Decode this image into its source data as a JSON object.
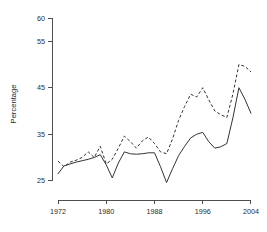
{
  "chart_data": {
    "type": "line",
    "title": "",
    "subtitle": "",
    "xlabel": "",
    "ylabel": "Percentage",
    "xlim": [
      1971,
      2005
    ],
    "ylim": [
      23,
      60
    ],
    "grid": false,
    "legend": "none",
    "background": "#ffffff",
    "line_color": "#333333",
    "axis_color": "#3d3d3d",
    "x_ticks": [
      1972,
      1980,
      1988,
      1996,
      2004
    ],
    "x_tick_labels": [
      "1972",
      "1980",
      "1988",
      "1996",
      "2004"
    ],
    "y_ticks": [
      25,
      35,
      45,
      55,
      60
    ],
    "y_tick_labels": [
      "25",
      "35",
      "45",
      "55",
      "60"
    ],
    "x": [
      1972,
      1973,
      1974,
      1975,
      1976,
      1977,
      1978,
      1979,
      1980,
      1981,
      1982,
      1983,
      1984,
      1985,
      1986,
      1987,
      1988,
      1989,
      1990,
      1991,
      1992,
      1993,
      1994,
      1995,
      1996,
      1997,
      1998,
      1999,
      2000,
      2001,
      2002,
      2003,
      2004
    ],
    "series": [
      {
        "name": "solid-series",
        "style": "solid",
        "values": [
          26.5,
          28.2,
          28.6,
          29.0,
          29.3,
          29.6,
          30.0,
          30.6,
          28.4,
          25.6,
          28.8,
          31.2,
          30.8,
          30.7,
          30.8,
          31.0,
          31.0,
          28.0,
          24.6,
          27.6,
          30.4,
          32.4,
          34.2,
          35.0,
          35.4,
          33.4,
          32.0,
          32.3,
          33.0,
          38.5,
          45.0,
          42.5,
          39.5
        ]
      },
      {
        "name": "dashed-series",
        "style": "dashed",
        "values": [
          29.2,
          28.0,
          29.0,
          29.4,
          30.0,
          31.2,
          30.0,
          32.4,
          28.6,
          29.6,
          32.0,
          34.6,
          33.4,
          32.0,
          33.6,
          34.4,
          33.0,
          31.2,
          30.8,
          34.0,
          38.0,
          41.0,
          43.6,
          43.0,
          45.0,
          42.4,
          40.0,
          39.2,
          38.6,
          43.6,
          50.0,
          49.6,
          48.4
        ]
      }
    ]
  }
}
